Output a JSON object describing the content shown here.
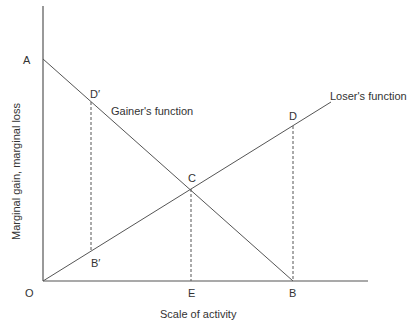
{
  "diagram": {
    "axes": {
      "x_label": "Scale of activity",
      "y_label": "Marginal gain, marginal loss",
      "origin_label": "O"
    },
    "lines": {
      "gainer": {
        "label": "Gainer's function",
        "from": "A",
        "to": "B"
      },
      "loser": {
        "label": "Loser's function",
        "from": "O",
        "through": "D"
      }
    },
    "points": {
      "A": "A",
      "B": "B",
      "C": "C",
      "D": "D",
      "D_prime": "D′",
      "B_prime": "B′",
      "E": "E"
    },
    "colors": {
      "line": "#555555",
      "text": "#333333",
      "background": "#ffffff"
    }
  }
}
